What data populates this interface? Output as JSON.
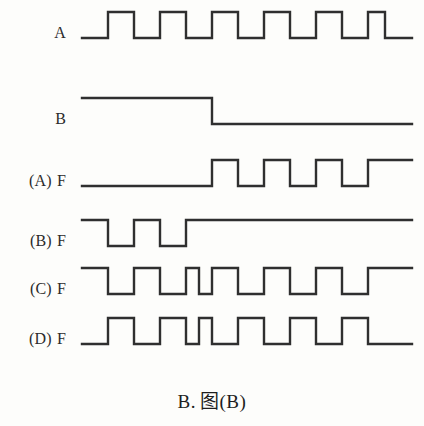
{
  "figure": {
    "caption_letter": "B.",
    "caption_text": "图(B)",
    "ink_color": "#2f2f2f",
    "background_color": "#fdfdfb"
  },
  "chart_data": {
    "type": "line",
    "title": "",
    "subtitle": "",
    "xlabel": "",
    "ylabel": "",
    "grid": false,
    "legend_position": "left",
    "x_axis": {
      "start_px": 82,
      "end_px": 412,
      "clock_period_px": 52,
      "half_period_px": 26,
      "unit": "clock half-period"
    },
    "series": [
      {
        "name": "A",
        "label": "A",
        "label_prefix": "",
        "signal": "A",
        "initial_level": 0,
        "baseline_y": 38,
        "top_y": 12,
        "transitions_px": [
          108,
          134,
          160,
          186,
          212,
          238,
          264,
          290,
          316,
          342,
          368,
          385
        ],
        "levels": [
          0,
          1,
          0,
          1,
          0,
          1,
          0,
          1,
          0,
          1,
          0,
          1,
          0
        ],
        "end_px": 412
      },
      {
        "name": "B",
        "label": "B",
        "label_prefix": "",
        "signal": "B",
        "initial_level": 1,
        "baseline_y": 124,
        "top_y": 98,
        "transitions_px": [
          212
        ],
        "levels": [
          1,
          0
        ],
        "end_px": 412
      },
      {
        "name": "F_A",
        "label": "F",
        "label_prefix": "(A)",
        "signal": "F",
        "initial_level": 0,
        "baseline_y": 186,
        "top_y": 160,
        "transitions_px": [
          212,
          238,
          264,
          290,
          316,
          342,
          368
        ],
        "levels": [
          0,
          1,
          0,
          1,
          0,
          1,
          0,
          1
        ],
        "end_px": 412
      },
      {
        "name": "F_B",
        "label": "F",
        "label_prefix": "(B)",
        "signal": "F",
        "initial_level": 1,
        "baseline_y": 246,
        "top_y": 220,
        "transitions_px": [
          108,
          134,
          160,
          186
        ],
        "levels": [
          1,
          0,
          1,
          0,
          1
        ],
        "end_px": 412
      },
      {
        "name": "F_C",
        "label": "F",
        "label_prefix": "(C)",
        "signal": "F",
        "initial_level": 1,
        "baseline_y": 294,
        "top_y": 268,
        "transitions_px": [
          108,
          134,
          160,
          186,
          199,
          212,
          238,
          264,
          290,
          316,
          342,
          368
        ],
        "levels": [
          1,
          0,
          1,
          0,
          1,
          0,
          1,
          0,
          1,
          0,
          1,
          0,
          1
        ],
        "end_px": 412,
        "note": "narrow half-width pulse at the B falling edge"
      },
      {
        "name": "F_D",
        "label": "F",
        "label_prefix": "(D)",
        "signal": "F",
        "initial_level": 0,
        "baseline_y": 344,
        "top_y": 318,
        "transitions_px": [
          108,
          134,
          160,
          186,
          199,
          212,
          238,
          264,
          290,
          316,
          342,
          368
        ],
        "levels": [
          0,
          1,
          0,
          1,
          0,
          1,
          0,
          1,
          0,
          1,
          0,
          1,
          0
        ],
        "end_px": 412,
        "note": "narrow half-width low pulse at the B falling edge"
      }
    ],
    "row_labels": [
      {
        "prefix": "",
        "signal": "A",
        "y": 25
      },
      {
        "prefix": "",
        "signal": "B",
        "y": 111
      },
      {
        "prefix": "(A)",
        "signal": "F",
        "y": 173
      },
      {
        "prefix": "(B)",
        "signal": "F",
        "y": 233
      },
      {
        "prefix": "(C)",
        "signal": "F",
        "y": 281
      },
      {
        "prefix": "(D)",
        "signal": "F",
        "y": 331
      }
    ]
  }
}
